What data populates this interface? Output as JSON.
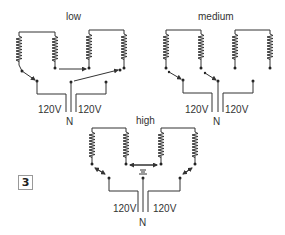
{
  "figure_number": "3",
  "diagrams": [
    {
      "id": "low",
      "label": "low",
      "left_voltage": "120V",
      "right_voltage": "120V",
      "neutral": "N"
    },
    {
      "id": "medium",
      "label": "medium",
      "left_voltage": "120V",
      "right_voltage": "120V",
      "neutral": "N"
    },
    {
      "id": "high",
      "label": "high",
      "left_voltage": "120V",
      "right_voltage": "120V",
      "neutral": "N"
    }
  ],
  "colors": {
    "line": "#333333",
    "badge_border": "#999999"
  }
}
